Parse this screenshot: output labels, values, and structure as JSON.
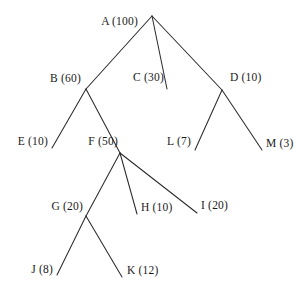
{
  "diagram": {
    "type": "tree",
    "background_color": "#ffffff",
    "line_color": "#2b2b2b",
    "text_color": "#1a1a1a"
  },
  "nodes": [
    {
      "id": "A",
      "label": "A (100)",
      "name": "A",
      "value": 100,
      "x": 152,
      "y": 16,
      "label_x": 138,
      "label_y": 22,
      "anchor": "right",
      "depth": 0
    },
    {
      "id": "B",
      "label": "B (60)",
      "name": "B",
      "value": 60,
      "x": 86,
      "y": 89,
      "label_x": 81,
      "label_y": 79,
      "anchor": "right",
      "depth": 1
    },
    {
      "id": "C",
      "label": "C (30)",
      "name": "C",
      "value": 30,
      "x": 167,
      "y": 89,
      "label_x": 164,
      "label_y": 78,
      "anchor": "right",
      "depth": 1
    },
    {
      "id": "D",
      "label": "D (10)",
      "name": "D",
      "value": 10,
      "x": 222,
      "y": 90,
      "label_x": 230,
      "label_y": 78,
      "anchor": "left",
      "depth": 1
    },
    {
      "id": "E",
      "label": "E (10)",
      "name": "E",
      "value": 10,
      "x": 52,
      "y": 148,
      "label_x": 48,
      "label_y": 142,
      "anchor": "right",
      "depth": 2
    },
    {
      "id": "F",
      "label": "F (50)",
      "name": "F",
      "value": 50,
      "x": 120,
      "y": 153,
      "label_x": 118,
      "label_y": 142,
      "anchor": "right",
      "depth": 2
    },
    {
      "id": "L",
      "label": "L (7)",
      "name": "L",
      "value": 7,
      "x": 195,
      "y": 150,
      "label_x": 191,
      "label_y": 142,
      "anchor": "right",
      "depth": 2
    },
    {
      "id": "M",
      "label": "M (3)",
      "name": "M",
      "value": 3,
      "x": 262,
      "y": 150,
      "label_x": 266,
      "label_y": 144,
      "anchor": "left",
      "depth": 2
    },
    {
      "id": "G",
      "label": "G (20)",
      "name": "G",
      "value": 20,
      "x": 86,
      "y": 216,
      "label_x": 83,
      "label_y": 207,
      "anchor": "right",
      "depth": 3
    },
    {
      "id": "H",
      "label": "H (10)",
      "name": "H",
      "value": 10,
      "x": 137,
      "y": 214,
      "label_x": 141,
      "label_y": 208,
      "anchor": "left",
      "depth": 3
    },
    {
      "id": "I",
      "label": "I (20)",
      "name": "I",
      "value": 20,
      "x": 197,
      "y": 213,
      "label_x": 201,
      "label_y": 206,
      "anchor": "left",
      "depth": 3
    },
    {
      "id": "J",
      "label": "J (8)",
      "name": "J",
      "value": 8,
      "x": 57,
      "y": 275,
      "label_x": 53,
      "label_y": 270,
      "anchor": "right",
      "depth": 4
    },
    {
      "id": "K",
      "label": "K (12)",
      "name": "K",
      "value": 12,
      "x": 122,
      "y": 277,
      "label_x": 127,
      "label_y": 271,
      "anchor": "left",
      "depth": 4
    }
  ],
  "edges": [
    {
      "from": "A",
      "to": "B",
      "x1": 152,
      "y1": 16,
      "x2": 86,
      "y2": 89
    },
    {
      "from": "A",
      "to": "C",
      "x1": 152,
      "y1": 16,
      "x2": 167,
      "y2": 89
    },
    {
      "from": "A",
      "to": "D",
      "x1": 152,
      "y1": 16,
      "x2": 222,
      "y2": 90
    },
    {
      "from": "B",
      "to": "E",
      "x1": 86,
      "y1": 89,
      "x2": 52,
      "y2": 148
    },
    {
      "from": "B",
      "to": "F",
      "x1": 86,
      "y1": 89,
      "x2": 120,
      "y2": 153
    },
    {
      "from": "D",
      "to": "L",
      "x1": 222,
      "y1": 90,
      "x2": 195,
      "y2": 150
    },
    {
      "from": "D",
      "to": "M",
      "x1": 222,
      "y1": 90,
      "x2": 262,
      "y2": 150
    },
    {
      "from": "F",
      "to": "G",
      "x1": 120,
      "y1": 153,
      "x2": 86,
      "y2": 216
    },
    {
      "from": "F",
      "to": "H",
      "x1": 120,
      "y1": 153,
      "x2": 137,
      "y2": 214
    },
    {
      "from": "F",
      "to": "I",
      "x1": 120,
      "y1": 153,
      "x2": 197,
      "y2": 213
    },
    {
      "from": "G",
      "to": "J",
      "x1": 86,
      "y1": 216,
      "x2": 57,
      "y2": 275
    },
    {
      "from": "G",
      "to": "K",
      "x1": 86,
      "y1": 216,
      "x2": 122,
      "y2": 277
    }
  ]
}
